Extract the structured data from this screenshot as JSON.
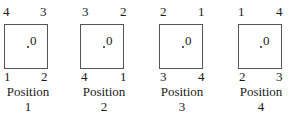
{
  "positions": [
    {
      "caption": "Position",
      "number": "1",
      "corners": {
        "top_left": "4",
        "top_right": "3",
        "bottom_left": "1",
        "bottom_right": "2"
      },
      "origin_label": "0"
    },
    {
      "caption": "Position",
      "number": "2",
      "corners": {
        "top_left": "3",
        "top_right": "2",
        "bottom_left": "4",
        "bottom_right": "1"
      },
      "origin_label": "0"
    },
    {
      "caption": "Position",
      "number": "3",
      "corners": {
        "top_left": "2",
        "top_right": "1",
        "bottom_left": "3",
        "bottom_right": "4"
      },
      "origin_label": "0"
    },
    {
      "caption": "Position",
      "number": "4",
      "corners": {
        "top_left": "1",
        "top_right": "4",
        "bottom_left": "2",
        "bottom_right": "3"
      },
      "origin_label": "0"
    }
  ]
}
